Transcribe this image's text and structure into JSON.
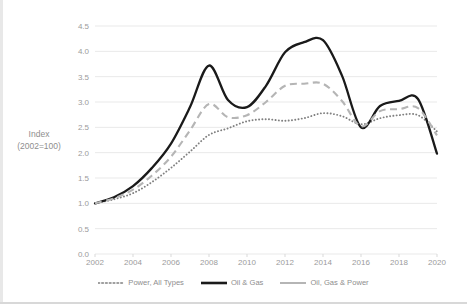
{
  "chart_data": {
    "type": "line",
    "title": "",
    "subtitle": "",
    "xlabel": "",
    "ylabel": "Index (2002=100)",
    "ylabel_line1": "Index",
    "ylabel_line2": "(2002=100)",
    "grid": "horizontal",
    "legend_position": "bottom",
    "xlim": [
      2002,
      2020
    ],
    "ylim": [
      0.0,
      4.5
    ],
    "yticks": [
      "4.5",
      "4.0",
      "3.5",
      "3.0",
      "2.5",
      "2.0",
      "1.5",
      "1.0",
      "0.5",
      "0.0"
    ],
    "ytick_values": [
      4.5,
      4.0,
      3.5,
      3.0,
      2.5,
      2.0,
      1.5,
      1.0,
      0.5,
      0.0
    ],
    "xticks": [
      "2002",
      "2004",
      "2006",
      "2008",
      "2010",
      "2012",
      "2014",
      "2016",
      "2018",
      "2020"
    ],
    "xtick_values": [
      2002,
      2004,
      2006,
      2008,
      2010,
      2012,
      2014,
      2016,
      2018,
      2020
    ],
    "x": [
      2002,
      2003,
      2004,
      2005,
      2006,
      2007,
      2008,
      2009,
      2010,
      2011,
      2012,
      2013,
      2014,
      2015,
      2016,
      2017,
      2018,
      2019,
      2020
    ],
    "series": [
      {
        "name": "Power, All Types",
        "style": "dotted",
        "color": "#808080",
        "values": [
          1.0,
          1.08,
          1.2,
          1.42,
          1.7,
          2.02,
          2.35,
          2.48,
          2.62,
          2.66,
          2.63,
          2.68,
          2.78,
          2.72,
          2.56,
          2.68,
          2.74,
          2.74,
          2.42
        ]
      },
      {
        "name": "Oil & Gas",
        "style": "solid",
        "color": "#1a1a1a",
        "values": [
          1.0,
          1.12,
          1.34,
          1.7,
          2.18,
          2.9,
          3.72,
          3.04,
          2.9,
          3.32,
          3.98,
          4.18,
          4.22,
          3.52,
          2.5,
          2.92,
          3.02,
          3.06,
          1.98
        ]
      },
      {
        "name": "Oil, Gas & Power",
        "style": "dashed",
        "color": "#b5b5b5",
        "values": [
          1.0,
          1.1,
          1.27,
          1.55,
          1.92,
          2.44,
          2.96,
          2.7,
          2.74,
          3.0,
          3.32,
          3.36,
          3.36,
          3.02,
          2.52,
          2.82,
          2.86,
          2.88,
          2.34
        ]
      }
    ],
    "colors": {
      "power_all_types": "#808080",
      "oil_and_gas": "#1a1a1a",
      "oil_gas_and_power": "#b5b5b5",
      "gridline": "#e9e9e9",
      "tick_text": "#9b9b9b"
    }
  },
  "legend": {
    "items": [
      {
        "label": "Power, All Types"
      },
      {
        "label": "Oil & Gas"
      },
      {
        "label": "Oil, Gas & Power"
      }
    ]
  }
}
